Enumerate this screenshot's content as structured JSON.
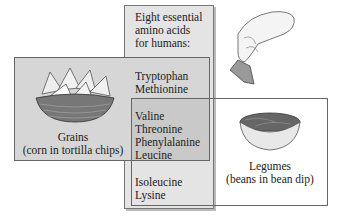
{
  "title": "Eight essential amino acids for humans:",
  "title_lines": [
    "Eight essential",
    "amino acids",
    "for humans:"
  ],
  "amino_acid_groups": [
    {
      "name": "grains-only",
      "items": [
        "Tryptophan",
        "Methionine"
      ]
    },
    {
      "name": "both",
      "items": [
        "Valine",
        "Threonine",
        "Phenylalanine",
        "Leucine"
      ]
    },
    {
      "name": "legumes-only",
      "items": [
        "Isoleucine",
        "Lysine"
      ]
    }
  ],
  "grains": {
    "label": "Grains",
    "sublabel": "(corn in tortilla chips)",
    "icon": "tortilla-chips-basket"
  },
  "legumes": {
    "label": "Legumes",
    "sublabel": "(beans in bean dip)",
    "icon": "bean-dip-bowl"
  },
  "illustration": {
    "icon": "hand-holding-chip-with-dip"
  }
}
